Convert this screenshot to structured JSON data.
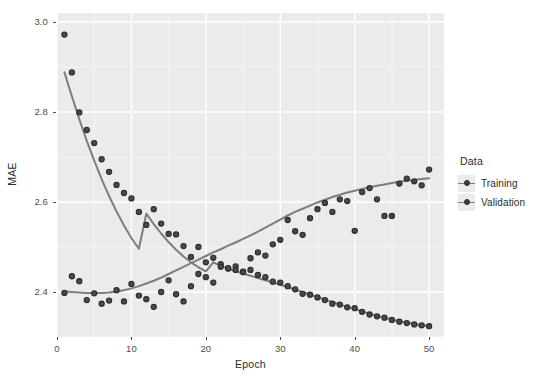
{
  "chart_data": {
    "type": "scatter",
    "title": "",
    "xlabel": "Epoch",
    "ylabel": "MAE",
    "xlim": [
      0,
      52
    ],
    "ylim": [
      2.3,
      3.02
    ],
    "xticks": [
      0,
      10,
      20,
      30,
      40,
      50
    ],
    "xtick_labels": [
      "0",
      "10",
      "20",
      "30",
      "40",
      "50"
    ],
    "yticks": [
      2.4,
      2.6,
      2.8,
      3.0
    ],
    "ytick_labels": [
      "2.4",
      "2.6",
      "2.8",
      "3.0"
    ],
    "grid": true,
    "grid_major_color": "#ffffff",
    "grid_minor_color": "#f5f5f5",
    "panel_background": "#ebebeb",
    "point_fill": "#4a4a4a",
    "point_stroke": "#2b2b2b",
    "smooth_line_color": "#7d7d7d",
    "legend": {
      "title": "Data",
      "position": "right",
      "entries": [
        "Training",
        "Validation"
      ]
    },
    "x": [
      1,
      2,
      3,
      4,
      5,
      6,
      7,
      8,
      9,
      10,
      11,
      12,
      13,
      14,
      15,
      16,
      17,
      18,
      19,
      20,
      21,
      22,
      23,
      24,
      25,
      26,
      27,
      28,
      29,
      30,
      31,
      32,
      33,
      34,
      35,
      36,
      37,
      38,
      39,
      40,
      41,
      42,
      43,
      44,
      45,
      46,
      47,
      48,
      49,
      50
    ],
    "series": [
      {
        "name": "Training",
        "values": [
          2.972,
          2.888,
          2.799,
          2.76,
          2.731,
          2.695,
          2.667,
          2.638,
          2.62,
          2.608,
          2.578,
          2.549,
          2.584,
          2.552,
          2.529,
          2.528,
          2.502,
          2.478,
          2.5,
          2.466,
          2.476,
          2.462,
          2.452,
          2.457,
          2.445,
          2.449,
          2.438,
          2.433,
          2.423,
          2.421,
          2.413,
          2.406,
          2.396,
          2.394,
          2.388,
          2.382,
          2.374,
          2.372,
          2.366,
          2.364,
          2.356,
          2.35,
          2.346,
          2.343,
          2.338,
          2.334,
          2.331,
          2.328,
          2.326,
          2.324
        ],
        "smooth": [
          2.888,
          2.835,
          2.784,
          2.736,
          2.692,
          2.651,
          2.613,
          2.579,
          2.548,
          2.52,
          2.496,
          2.574,
          2.551,
          2.53,
          2.511,
          2.494,
          2.479,
          2.466,
          2.455,
          2.446,
          2.466,
          2.458,
          2.452,
          2.446,
          2.441,
          2.436,
          2.431,
          2.426,
          2.421,
          2.416,
          2.411,
          2.405,
          2.4,
          2.394,
          2.389,
          2.383,
          2.378,
          2.372,
          2.367,
          2.362,
          2.357,
          2.352,
          2.347,
          2.343,
          2.339,
          2.335,
          2.332,
          2.329,
          2.326,
          2.324
        ]
      },
      {
        "name": "Validation",
        "values": [
          2.398,
          2.435,
          2.424,
          2.382,
          2.397,
          2.374,
          2.381,
          2.404,
          2.379,
          2.418,
          2.392,
          2.384,
          2.367,
          2.4,
          2.426,
          2.395,
          2.379,
          2.413,
          2.44,
          2.433,
          2.421,
          2.456,
          2.453,
          2.449,
          2.444,
          2.475,
          2.488,
          2.481,
          2.506,
          2.516,
          2.56,
          2.535,
          2.527,
          2.564,
          2.584,
          2.598,
          2.578,
          2.606,
          2.602,
          2.536,
          2.622,
          2.631,
          2.606,
          2.569,
          2.569,
          2.641,
          2.652,
          2.646,
          2.637,
          2.672
        ],
        "smooth": [
          2.401,
          2.4,
          2.399,
          2.398,
          2.398,
          2.398,
          2.399,
          2.401,
          2.404,
          2.408,
          2.413,
          2.419,
          2.425,
          2.432,
          2.44,
          2.448,
          2.456,
          2.464,
          2.472,
          2.48,
          2.488,
          2.495,
          2.503,
          2.51,
          2.518,
          2.526,
          2.534,
          2.543,
          2.552,
          2.561,
          2.57,
          2.578,
          2.585,
          2.592,
          2.599,
          2.605,
          2.611,
          2.616,
          2.621,
          2.625,
          2.629,
          2.633,
          2.636,
          2.639,
          2.642,
          2.645,
          2.647,
          2.649,
          2.651,
          2.653
        ]
      }
    ]
  },
  "axes": {
    "y_title": "MAE",
    "x_title": "Epoch"
  },
  "legend": {
    "title": "Data",
    "items": [
      {
        "label": "Training"
      },
      {
        "label": "Validation"
      }
    ]
  }
}
